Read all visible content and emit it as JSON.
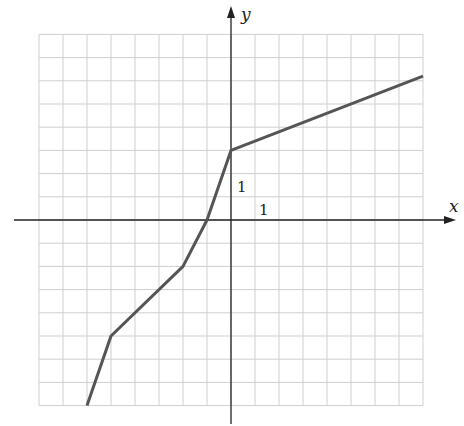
{
  "chart_data": {
    "type": "line",
    "title": "",
    "xlabel": "x",
    "ylabel": "y",
    "xlim": [
      -8,
      8
    ],
    "ylim": [
      -8,
      8
    ],
    "grid": true,
    "tick_labels": {
      "x_unit": "1",
      "y_unit": "1"
    },
    "series": [
      {
        "name": "piecewise-linear",
        "points": [
          [
            -6,
            -8
          ],
          [
            -5,
            -5
          ],
          [
            -2,
            -2
          ],
          [
            -1,
            0
          ],
          [
            0,
            3
          ],
          [
            8,
            6.2
          ]
        ]
      }
    ]
  },
  "colors": {
    "grid": "#cfcfcf",
    "axis": "#222222",
    "line": "#555555",
    "background": "#ffffff"
  }
}
